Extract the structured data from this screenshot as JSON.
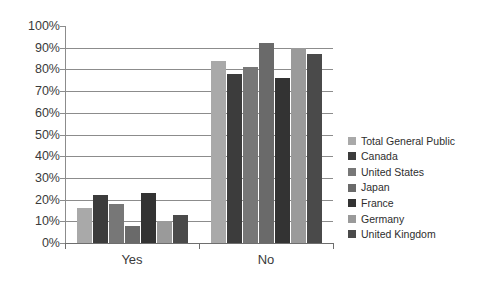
{
  "chart_data": {
    "type": "bar",
    "title": "",
    "xlabel": "",
    "ylabel": "",
    "categories": [
      "Yes",
      "No"
    ],
    "ylim": [
      0,
      100
    ],
    "yticks": [
      "0%",
      "10%",
      "20%",
      "30%",
      "40%",
      "50%",
      "60%",
      "70%",
      "80%",
      "90%",
      "100%"
    ],
    "ytick_values": [
      0,
      10,
      20,
      30,
      40,
      50,
      60,
      70,
      80,
      90,
      100
    ],
    "grid": true,
    "legend_position": "right",
    "series": [
      {
        "name": "Total General Public",
        "color": "#a9a9a9",
        "values": [
          16,
          84
        ]
      },
      {
        "name": "Canada",
        "color": "#3c3c3c",
        "values": [
          22,
          78
        ]
      },
      {
        "name": "United States",
        "color": "#777777",
        "values": [
          18,
          81
        ]
      },
      {
        "name": "Japan",
        "color": "#6a6a6a",
        "values": [
          8,
          92
        ]
      },
      {
        "name": "France",
        "color": "#333333",
        "values": [
          23,
          76
        ]
      },
      {
        "name": "Germany",
        "color": "#9a9a9a",
        "values": [
          10,
          90
        ]
      },
      {
        "name": "United Kingdom",
        "color": "#4a4a4a",
        "values": [
          13,
          87
        ]
      }
    ]
  },
  "legend": {
    "items": [
      "Total General Public",
      "Canada",
      "United States",
      "Japan",
      "France",
      "Germany",
      "United Kingdom"
    ]
  },
  "axis": {
    "y_labels": [
      "100%",
      "90%",
      "80%",
      "70%",
      "60%",
      "50%",
      "40%",
      "30%",
      "20%",
      "10%",
      "0%"
    ],
    "x_labels": [
      "Yes",
      "No"
    ]
  },
  "colors": {
    "grid": "#8c8c8c",
    "axis": "#6e6e6e",
    "text": "#3a3a3a",
    "background": "#ffffff"
  }
}
